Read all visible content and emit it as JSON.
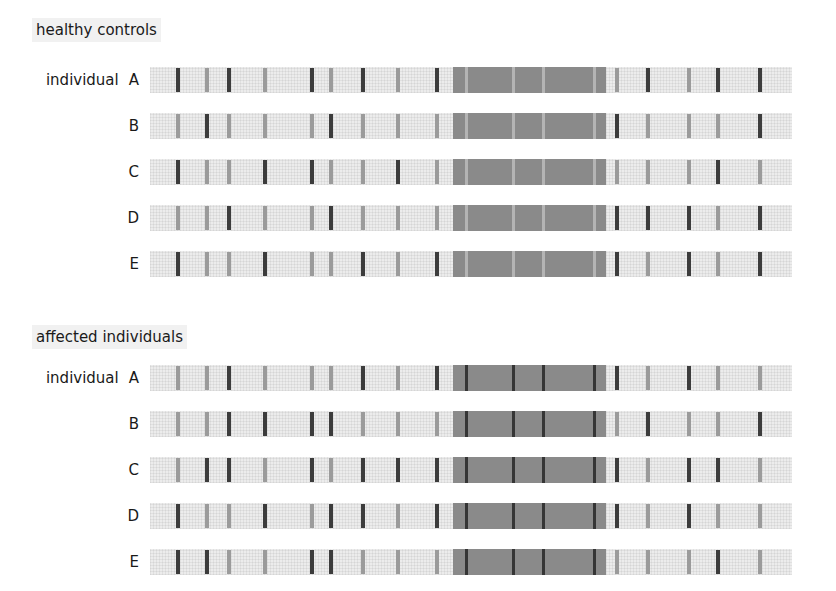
{
  "colors": {
    "dark_band": "#3c3c3c",
    "light_band": "#9b9b9b",
    "block": "#8a8a8a",
    "strip": "#ececec"
  },
  "layout": {
    "band_positions": [
      178,
      207,
      229,
      265,
      312,
      331,
      363,
      398,
      437,
      617,
      648,
      689,
      718,
      760
    ],
    "block": {
      "start": 453,
      "end": 606,
      "line_positions": [
        466,
        513,
        543,
        594
      ]
    }
  },
  "sections": [
    {
      "title": "healthy controls",
      "block_line_shade": "light",
      "rows": [
        {
          "prefix": "individual",
          "label": "A",
          "bands": [
            "dark",
            "light",
            "dark",
            "light",
            "dark",
            "light",
            "dark",
            "light",
            "dark",
            "light",
            "dark",
            "light",
            "dark",
            "dark"
          ]
        },
        {
          "prefix": "",
          "label": "B",
          "bands": [
            "light",
            "dark",
            "light",
            "light",
            "light",
            "dark",
            "light",
            "light",
            "light",
            "dark",
            "light",
            "light",
            "light",
            "dark"
          ]
        },
        {
          "prefix": "",
          "label": "C",
          "bands": [
            "dark",
            "light",
            "light",
            "dark",
            "dark",
            "light",
            "light",
            "dark",
            "light",
            "light",
            "light",
            "light",
            "dark",
            "light"
          ]
        },
        {
          "prefix": "",
          "label": "D",
          "bands": [
            "light",
            "light",
            "dark",
            "light",
            "light",
            "dark",
            "light",
            "light",
            "light",
            "dark",
            "dark",
            "dark",
            "light",
            "dark"
          ]
        },
        {
          "prefix": "",
          "label": "E",
          "bands": [
            "dark",
            "light",
            "light",
            "dark",
            "light",
            "light",
            "dark",
            "light",
            "dark",
            "dark",
            "light",
            "dark",
            "light",
            "dark"
          ]
        }
      ]
    },
    {
      "title": "affected individuals",
      "block_line_shade": "dark",
      "rows": [
        {
          "prefix": "individual",
          "label": "A",
          "bands": [
            "light",
            "light",
            "dark",
            "light",
            "light",
            "light",
            "dark",
            "light",
            "dark",
            "dark",
            "light",
            "dark",
            "light",
            "light"
          ]
        },
        {
          "prefix": "",
          "label": "B",
          "bands": [
            "light",
            "light",
            "dark",
            "dark",
            "dark",
            "dark",
            "light",
            "light",
            "light",
            "light",
            "dark",
            "light",
            "light",
            "dark"
          ]
        },
        {
          "prefix": "",
          "label": "C",
          "bands": [
            "light",
            "dark",
            "dark",
            "light",
            "dark",
            "light",
            "dark",
            "dark",
            "dark",
            "dark",
            "light",
            "dark",
            "dark",
            "light"
          ]
        },
        {
          "prefix": "",
          "label": "D",
          "bands": [
            "dark",
            "light",
            "light",
            "dark",
            "light",
            "dark",
            "dark",
            "light",
            "dark",
            "dark",
            "light",
            "dark",
            "light",
            "light"
          ]
        },
        {
          "prefix": "",
          "label": "E",
          "bands": [
            "dark",
            "dark",
            "light",
            "light",
            "dark",
            "dark",
            "light",
            "light",
            "light",
            "light",
            "light",
            "light",
            "dark",
            "light"
          ]
        }
      ]
    }
  ]
}
